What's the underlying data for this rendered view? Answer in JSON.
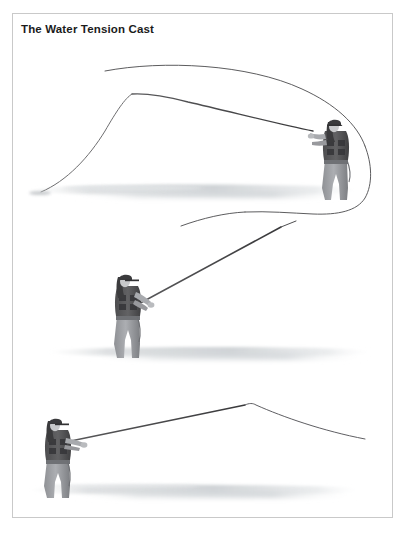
{
  "page": {
    "background_color": "#ffffff",
    "width": 408,
    "height": 537
  },
  "figure": {
    "title": "The Water Tension Cast",
    "frame_color": "#c9c9c9",
    "title_color": "#1b1b1b",
    "style": "grayscale pencil / airbrush instructional illustration",
    "panel_count": 3,
    "line_color": "#3c3c3c",
    "rod_color": "#474747",
    "water_color": "#d8dadc",
    "figure_dark": "#4a4a4a",
    "figure_mid": "#8d8d8d",
    "figure_light": "#b9b9b9"
  },
  "panels": [
    {
      "name": "panel-top",
      "caption": "",
      "description": "Angler standing in water at right, rod tip bent far back to the left, large fly line loop unrolling overhead and curling down on the right side.",
      "angler": {
        "x": 322,
        "y": 145,
        "facing": "left",
        "rod_hand": "right"
      },
      "waterline_y": 186
    },
    {
      "name": "panel-middle",
      "caption": "",
      "description": "Angler standing in water at left, rod angled steeply up and to the right, line straight along the rod toward the upper right.",
      "angler": {
        "x": 115,
        "y": 300,
        "facing": "right",
        "rod_hand": "right"
      },
      "waterline_y": 347
    },
    {
      "name": "panel-bottom",
      "caption": "",
      "description": "Angler at lower left, rod nearly horizontal pointing right, line forming a shallow peak then dropping away to the right.",
      "angler": {
        "x": 48,
        "y": 445,
        "facing": "right",
        "rod_hand": "right"
      },
      "waterline_y": 484
    }
  ],
  "icons": {
    "frame": "rectangle-frame-icon"
  }
}
